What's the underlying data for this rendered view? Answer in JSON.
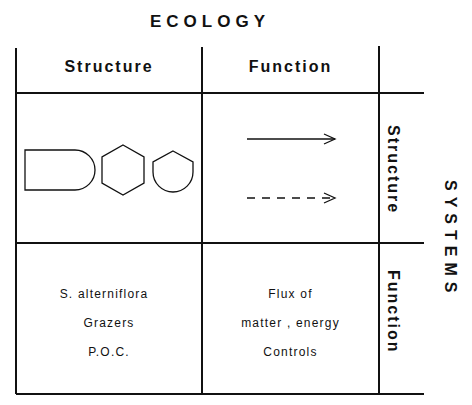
{
  "title": "ECOLOGY",
  "side_title": "SYSTEMS",
  "columns": [
    "Structure",
    "Function"
  ],
  "rows": [
    "Structure",
    "Function"
  ],
  "cells": {
    "structure_structure": {
      "shapes": [
        "rounded-rectangle",
        "hexagon",
        "pentagon-round-bottom"
      ]
    },
    "structure_function": {
      "arrows": [
        "solid-arrow",
        "dashed-arrow"
      ]
    },
    "function_structure": {
      "lines": [
        "S. alterniflora",
        "Grazers",
        "P.O.C."
      ]
    },
    "function_function": {
      "lines": [
        "Flux of",
        "matter , energy",
        "Controls"
      ]
    }
  }
}
